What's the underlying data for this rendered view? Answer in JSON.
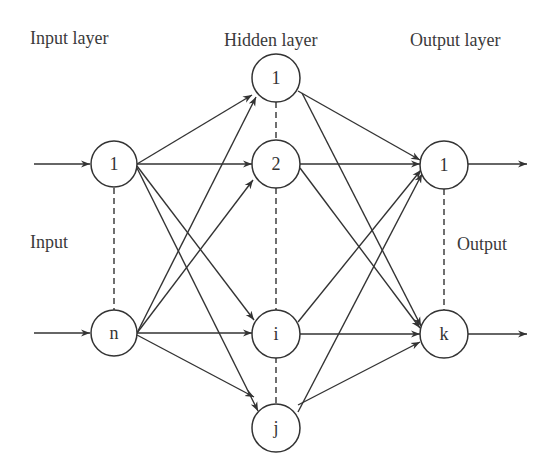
{
  "diagram": {
    "type": "neural-network",
    "colors": {
      "stroke": "#333333",
      "background": "#ffffff",
      "text": "#3a3a3a"
    },
    "labels": {
      "input_layer": "Input layer",
      "hidden_layer": "Hidden layer",
      "output_layer": "Output layer",
      "input": "Input",
      "output": "Output"
    },
    "layers": {
      "input": [
        {
          "id": "in1",
          "label": "1"
        },
        {
          "id": "inn",
          "label": "n"
        }
      ],
      "hidden": [
        {
          "id": "h1",
          "label": "1"
        },
        {
          "id": "h2",
          "label": "2"
        },
        {
          "id": "hi",
          "label": "i"
        },
        {
          "id": "hj",
          "label": "j"
        }
      ],
      "output": [
        {
          "id": "o1",
          "label": "1"
        },
        {
          "id": "ok",
          "label": "k"
        }
      ]
    },
    "connections": "fully-connected input→hidden, hidden→output"
  }
}
